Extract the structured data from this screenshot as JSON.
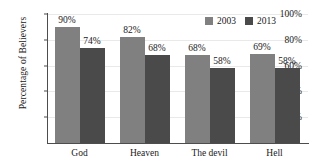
{
  "chart_data": {
    "type": "bar",
    "title": "",
    "subtitle": "",
    "xlabel": "",
    "ylabel": "Percentage of Believers",
    "categories": [
      "God",
      "Heaven",
      "The devil",
      "Hell"
    ],
    "series": [
      {
        "name": "2003",
        "color": "#808080",
        "values": [
          90,
          82,
          68,
          69
        ],
        "labels": [
          "90%",
          "82%",
          "68%",
          "69%"
        ]
      },
      {
        "name": "2013",
        "color": "#4a4a4a",
        "values": [
          74,
          68,
          58,
          58
        ],
        "labels": [
          "74%",
          "68%",
          "58%",
          "58%"
        ]
      }
    ],
    "ylim": [
      0,
      100
    ],
    "yticks": [
      20,
      40,
      60,
      80,
      100
    ],
    "ytick_labels": [
      "20%",
      "40%",
      "60%",
      "80%",
      "100%"
    ],
    "grid": true,
    "legend_position": "top-right",
    "value_labels": true,
    "units": "percent"
  },
  "legend": {
    "entries": [
      {
        "label": "2003",
        "color": "#808080"
      },
      {
        "label": "2013",
        "color": "#4a4a4a"
      }
    ]
  },
  "axes": {
    "y_title": "Percentage of Believers"
  }
}
